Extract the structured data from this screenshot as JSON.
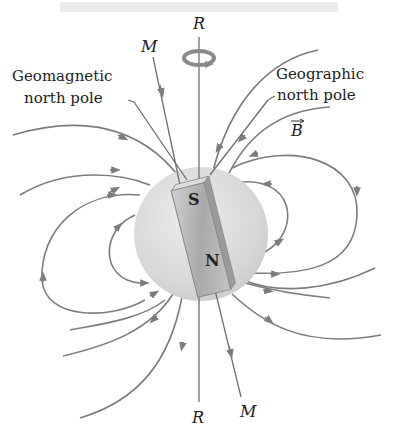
{
  "figure": {
    "type": "Earth magnetic field diagram",
    "labels": {
      "rotation_axis_top": "R",
      "rotation_axis_bottom": "R",
      "magnetic_axis_top": "M",
      "magnetic_axis_bottom": "M",
      "geomagnetic_line1": "Geomagnetic",
      "geomagnetic_line2": "north pole",
      "geographic_line1": "Geographic",
      "geographic_line2": "north pole",
      "field_vector": "B",
      "magnet_top_pole": "S",
      "magnet_bottom_pole": "N"
    },
    "colors": {
      "field_lines": "#7d7d7d",
      "sphere": "#d9d9d9",
      "magnet": "#bdbdbd",
      "text": "#222222"
    }
  }
}
